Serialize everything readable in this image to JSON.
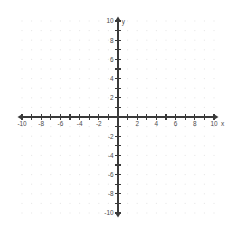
{
  "chart_data": {
    "type": "scatter",
    "title": "",
    "subtitle": "",
    "xlabel": "x",
    "ylabel": "y",
    "xlim": [
      -10,
      10
    ],
    "ylim": [
      -10,
      10
    ],
    "grid": true,
    "grid_style": "dots",
    "legend": null,
    "series": [],
    "values": [],
    "x_tick_step": 1,
    "y_tick_step": 1,
    "x_label_step": 2,
    "y_label_step": 2,
    "x_tick_labels": [
      "-10",
      "-8",
      "-6",
      "-4",
      "-2",
      "2",
      "4",
      "6",
      "8",
      "10"
    ],
    "x_tick_label_values": [
      -10,
      -8,
      -6,
      -4,
      -2,
      2,
      4,
      6,
      8,
      10
    ],
    "y_tick_labels": [
      "10",
      "8",
      "6",
      "4",
      "2",
      "-2",
      "-4",
      "-6",
      "-8",
      "-10"
    ],
    "y_tick_label_values": [
      10,
      8,
      6,
      4,
      2,
      -2,
      -4,
      -6,
      -8,
      -10
    ],
    "x_minor_tick_values": [
      -10,
      -9,
      -8,
      -7,
      -6,
      -5,
      -4,
      -3,
      -2,
      -1,
      1,
      2,
      3,
      4,
      5,
      6,
      7,
      8,
      9,
      10
    ],
    "y_minor_tick_values": [
      -10,
      -9,
      -8,
      -7,
      -6,
      -5,
      -4,
      -3,
      -2,
      -1,
      1,
      2,
      3,
      4,
      5,
      6,
      7,
      8,
      9,
      10
    ],
    "origin_label": "",
    "arrows": [
      "left",
      "right",
      "up",
      "down"
    ]
  },
  "figure": {
    "width": 237,
    "height": 233,
    "background_color": "#ffffff",
    "axis_color": "#3a3a3a",
    "label_color": "#4a4a4a",
    "grid_color": "#e8e8e8",
    "origin_px": {
      "x": 118,
      "y": 117
    },
    "unit_px": 9.6
  },
  "axis_labels": {
    "x_name": "x",
    "y_name": "y"
  }
}
